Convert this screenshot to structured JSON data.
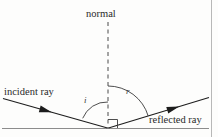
{
  "diagram": {
    "labels": {
      "normal": "normal",
      "incident_ray": "incident ray",
      "reflected_ray": "reflected ray",
      "angle_of_incidence": "i",
      "angle_of_reflection": "r"
    },
    "colors": {
      "line": "#2b2b2b",
      "surface": "#8c8c8c",
      "border": "#b0b0b0",
      "background": "#fdfdfc",
      "text": "#2a2a2a"
    },
    "geometry": {
      "vertex": {
        "x": 108,
        "y": 128
      },
      "normal_line": {
        "x": 108,
        "y_top": 22,
        "y_bottom": 128,
        "style": "dashed"
      },
      "surface_line": {
        "y": 128,
        "x_start": 4,
        "x_end": 208
      },
      "incident_ray": {
        "x_start": 4,
        "y_start": 99,
        "x_end": 108,
        "y_end": 128
      },
      "reflected_ray": {
        "x_start": 108,
        "y_start": 128,
        "x_end": 208,
        "y_end": 98
      },
      "incident_arrow": {
        "x": 44,
        "y": 110
      },
      "reflected_arrow": {
        "x": 172,
        "y": 110
      },
      "arc_i_radius": 26,
      "arc_r_radius": 42,
      "right_angle_size": 9
    },
    "elements": {
      "right_angle_marker": "right-angle-marker",
      "arc_incidence": "angle-arc-incidence",
      "arc_reflection": "angle-arc-reflection"
    }
  }
}
